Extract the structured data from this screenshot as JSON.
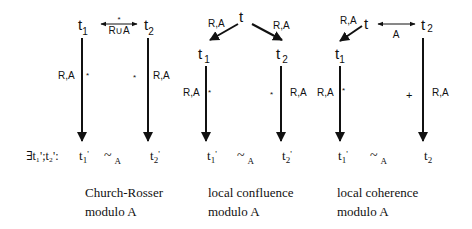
{
  "diagrams": [
    {
      "id": "church-rosser",
      "top_left": {
        "base": "t",
        "sub": "1"
      },
      "top_right": {
        "base": "t",
        "sub": "2"
      },
      "top_relation": {
        "star": "*",
        "label": "R∪A"
      },
      "left_edge": {
        "label": "R,A",
        "marker": "*"
      },
      "right_edge": {
        "label": "R,A",
        "marker": "*"
      },
      "bottom_prefix": "∃t₁';t₂':",
      "bottom_left": {
        "base": "t",
        "sub": "1",
        "prime": "'"
      },
      "bottom_equiv": {
        "symbol": "~",
        "sub": "A"
      },
      "bottom_right": {
        "base": "t",
        "sub": "2",
        "prime": "'"
      },
      "caption_line1": "Church-Rosser",
      "caption_line2": "modulo A"
    },
    {
      "id": "local-confluence",
      "top": "t",
      "left_branch_label": "R,A",
      "right_branch_label": "R,A",
      "mid_left": {
        "base": "t",
        "sub": "1"
      },
      "mid_right": {
        "base": "t",
        "sub": "2"
      },
      "left_edge": {
        "label": "R,A",
        "marker": "*"
      },
      "right_edge": {
        "label": "R,A",
        "marker": "*"
      },
      "bottom_left": {
        "base": "t",
        "sub": "1",
        "prime": "'"
      },
      "bottom_equiv": {
        "symbol": "~",
        "sub": "A"
      },
      "bottom_right": {
        "base": "t",
        "sub": "2",
        "prime": "'"
      },
      "caption_line1": "local confluence",
      "caption_line2": "modulo A"
    },
    {
      "id": "local-coherence",
      "top": "t",
      "left_branch_label": "R,A",
      "top_relation_label": "A",
      "top_right": {
        "base": "t",
        "sub": "2"
      },
      "mid_left": {
        "base": "t",
        "sub": "1"
      },
      "left_edge": {
        "label": "R,A",
        "marker": "*"
      },
      "right_edge": {
        "label": "R,A",
        "marker": "+"
      },
      "bottom_left": {
        "base": "t",
        "sub": "1",
        "prime": "'"
      },
      "bottom_equiv": {
        "symbol": "~",
        "sub": "A"
      },
      "bottom_right": {
        "base": "t",
        "sub": "2"
      },
      "caption_line1": "local coherence",
      "caption_line2": "modulo A"
    }
  ]
}
